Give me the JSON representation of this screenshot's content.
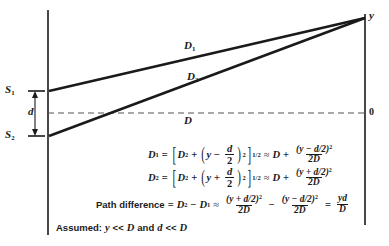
{
  "figure": {
    "type": "double-slit-interference-geometry",
    "labels": {
      "slit_1": "S",
      "slit_1_sub": "1",
      "slit_2": "S",
      "slit_2_sub": "2",
      "slit_separation": "d",
      "baseline_distance": "D",
      "screen_point": "y",
      "screen_origin": "0",
      "ray_1": "D",
      "ray_1_sub": "1",
      "ray_2": "D",
      "ray_2_sub": "2"
    },
    "equation_1": {
      "lhs": "D",
      "lhs_sub": "1",
      "equals": "=",
      "bracket_open": "[",
      "term_a": "D",
      "term_a_sup": "2",
      "plus": "+",
      "paren_open": "(",
      "var_y": "y",
      "minus": "−",
      "frac_num": "d",
      "frac_den": "2",
      "paren_close": ")",
      "paren_sup": "2",
      "bracket_close": "]",
      "bracket_sup": "1/2",
      "approx": "≈",
      "rhs_first": "D",
      "rhs_plus": "+",
      "rhs_num": "(y − d/2)",
      "rhs_num_sup": "2",
      "rhs_den": "2D"
    },
    "equation_2": {
      "lhs": "D",
      "lhs_sub": "2",
      "equals": "=",
      "bracket_open": "[",
      "term_a": "D",
      "term_a_sup": "2",
      "plus": "+",
      "paren_open": "(",
      "var_y": "y",
      "minus": "+",
      "frac_num": "d",
      "frac_den": "2",
      "paren_close": ")",
      "paren_sup": "2",
      "bracket_close": "]",
      "bracket_sup": "1/2",
      "approx": "≈",
      "rhs_first": "D",
      "rhs_plus": "+",
      "rhs_num": "(y + d/2)",
      "rhs_num_sup": "2",
      "rhs_den": "2D"
    },
    "equation_3": {
      "label": "Path difference",
      "equals": "=",
      "lhs_a": "D",
      "lhs_a_sub": "2",
      "minus": "−",
      "lhs_b": "D",
      "lhs_b_sub": "1",
      "approx": "≈",
      "t1_num": "(y + d/2)",
      "t1_num_sup": "2",
      "t1_den": "2D",
      "op": "−",
      "t2_num": "(y − d/2)",
      "t2_num_sup": "2",
      "t2_den": "2D",
      "eq2": "=",
      "result_num": "yd",
      "result_den": "D"
    },
    "assumption": {
      "prefix": "Assumed:",
      "cond_1_var": "y",
      "cond_1_rel": "<<",
      "cond_1_val": "D",
      "conjunction": "and",
      "cond_2_var": "d",
      "cond_2_rel": "<<",
      "cond_2_val": "D"
    },
    "colors": {
      "ink": "#1a1a1a",
      "background": "#ffffff",
      "dashed": "#555555"
    }
  }
}
